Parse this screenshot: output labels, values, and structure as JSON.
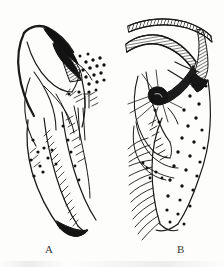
{
  "plate": {
    "kind": "scientific-line-drawing-plate",
    "background_color": "#fdfdfc",
    "ink_color": "#1a1a1a",
    "panel_count": 2
  },
  "figures": [
    {
      "id": "A",
      "label": "A",
      "label_position": {
        "x": 48,
        "y": 248
      },
      "description": "Left panel line drawing of an appendage with dark curved apical hook, hatched wedge, scattered setal sockets and comb rows of setae",
      "parts": [
        {
          "name": "apical-hook",
          "shading": "solid-black"
        },
        {
          "name": "hatched-wedge",
          "shading": "cross-hatch"
        },
        {
          "name": "setal-socket-field",
          "shading": "dots"
        },
        {
          "name": "upper-lobe",
          "shading": "outline"
        },
        {
          "name": "lower-lobe",
          "shading": "outline"
        },
        {
          "name": "setae-comb-row",
          "shading": "fine-lines"
        }
      ]
    },
    {
      "id": "B",
      "label": "B",
      "label_position": {
        "x": 180,
        "y": 248
      },
      "description": "Right panel line drawing with two hatched curved bands, hatched vertical strip, dark sensory knob with radiating bristles, and a large oval lobe bearing setal sockets and a marginal fringe of long setae",
      "parts": [
        {
          "name": "upper-hatched-band",
          "shading": "cross-hatch"
        },
        {
          "name": "lower-hatched-band",
          "shading": "cross-hatch"
        },
        {
          "name": "hatched-strip",
          "shading": "cross-hatch"
        },
        {
          "name": "sensory-knob",
          "shading": "solid-black"
        },
        {
          "name": "bristle-group",
          "shading": "fine-lines"
        },
        {
          "name": "oval-lobe",
          "shading": "outline"
        },
        {
          "name": "setal-socket-field",
          "shading": "dots"
        },
        {
          "name": "marginal-setae-fringe",
          "shading": "fine-lines"
        }
      ]
    }
  ]
}
